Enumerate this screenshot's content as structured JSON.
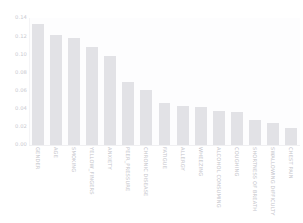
{
  "figure": {
    "title_fragment": "",
    "background_hex": "#ffffff",
    "bar_color_hex": "#e2e2e6",
    "tick_color_hex": "#c9c9cf",
    "label_color_hex": "#c4c4ca"
  },
  "chart_data": {
    "type": "bar",
    "title": "",
    "xlabel": "",
    "ylabel": "",
    "ylim": [
      0.0,
      0.14
    ],
    "grid": false,
    "legend": "none",
    "orientation": "vertical",
    "xtick_rotation": 90,
    "ytick_labels": [
      "0.14",
      "0.12",
      "0.10",
      "0.08",
      "0.06",
      "0.04",
      "0.02",
      "0.00"
    ],
    "ytick_values": [
      0.14,
      0.12,
      0.1,
      0.08,
      0.06,
      0.04,
      0.02,
      0.0
    ],
    "categories": [
      "GENDER",
      "AGE",
      "SMOKING",
      "YELLOW_FINGERS",
      "ANXIETY",
      "PEER_PRESSURE",
      "CHRONIC DISEASE",
      "FATIGUE",
      "ALLERGY",
      "WHEEZING",
      "ALCOHOL CONSUMING",
      "COUGHING",
      "SHORTNESS OF BREATH",
      "SWALLOWING DIFFICULTY",
      "CHEST PAIN"
    ],
    "values": [
      0.133,
      0.1208,
      0.1185,
      0.1085,
      0.0985,
      0.069,
      0.0608,
      0.0462,
      0.0425,
      0.0418,
      0.0372,
      0.0365,
      0.0278,
      0.0243,
      0.0192
    ]
  }
}
